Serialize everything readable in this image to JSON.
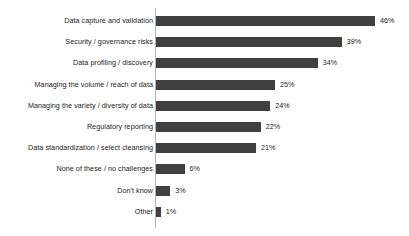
{
  "chart_data": {
    "type": "bar",
    "orientation": "horizontal",
    "title": "",
    "subtitle": "",
    "xlabel": "",
    "ylabel": "",
    "xlim": [
      0,
      46
    ],
    "grid": false,
    "legend": false,
    "value_suffix": "%",
    "bar_color": "#404040",
    "axis_color": "#b5b5b5",
    "background_color": "#ffffff",
    "categories": [
      "Data capture and validation",
      "Security / governance risks",
      "Data profiling / discovery",
      "Managing the volume / reach of data",
      "Managing the variety / diversity of data",
      "Regulatory reporting",
      "Data standardization / select cleansing",
      "None of these / no challenges",
      "Don't know",
      "Other"
    ],
    "values": [
      46,
      39,
      34,
      25,
      24,
      22,
      21,
      6,
      3,
      1
    ],
    "value_labels": [
      "46%",
      "39%",
      "34%",
      "25%",
      "24%",
      "22%",
      "21%",
      "6%",
      "3%",
      "1%"
    ]
  }
}
